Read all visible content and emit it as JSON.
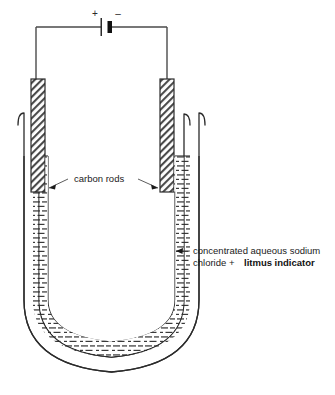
{
  "diagram": {
    "background_color": "#ffffff",
    "line_color": "#2b2b2b",
    "text_color": "#1a1a1a",
    "circuit": {
      "battery": {
        "name": "battery-cell",
        "positive_sign": "+",
        "negative_sign": "–",
        "positive_side": "left",
        "negative_side": "right"
      },
      "wire_color": "#4a4a4a"
    },
    "labels": [
      {
        "id": "carbon-rods",
        "text": "carbon rods",
        "bold": false,
        "x": 74,
        "y": 182,
        "leaders": [
          "left",
          "right"
        ]
      },
      {
        "id": "electrolyte-line1",
        "text": "concentrated aqueous sodium",
        "bold": false,
        "x": 193,
        "y": 254
      },
      {
        "id": "electrolyte-line2-plain",
        "text": "chloride + ",
        "bold": false,
        "x": 193,
        "y": 266
      },
      {
        "id": "electrolyte-line2-bold",
        "text": "litmus indicator",
        "bold": true,
        "x": 243,
        "y": 266
      }
    ],
    "components": {
      "left_electrode": "carbon rod (anode, connected to +)",
      "right_electrode": "carbon rod (cathode, connected to –)",
      "vessel": "U-tube",
      "liquid": "concentrated aqueous sodium chloride + litmus indicator",
      "liquid_fill_pattern": "horizontal dashes",
      "rod_fill_pattern": "diagonal hatching"
    }
  }
}
